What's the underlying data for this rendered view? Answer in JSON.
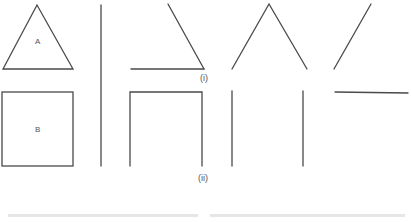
{
  "figure": {
    "shape_a": {
      "label": "A",
      "type": "triangle"
    },
    "shape_b": {
      "label": "B",
      "type": "square"
    },
    "row_labels": {
      "row_i": "(i)",
      "row_ii": "(ii)"
    },
    "stroke_color": "#4a4a4a",
    "label_color": "#555555"
  }
}
